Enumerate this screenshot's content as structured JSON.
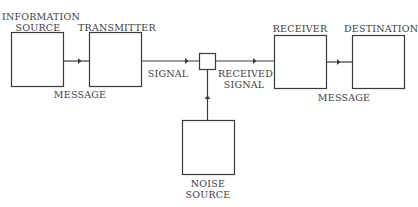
{
  "diagram": {
    "title": "",
    "nodes": [
      {
        "id": "information_source",
        "label_line1": "INFORMATION",
        "label_line2": "SOURCE"
      },
      {
        "id": "transmitter",
        "label_line1": "TRANSMITTER"
      },
      {
        "id": "receiver",
        "label_line1": "RECEIVER"
      },
      {
        "id": "destination",
        "label_line1": "DESTINATION"
      },
      {
        "id": "noise_source",
        "label_line1": "NOISE",
        "label_line2": "SOURCE"
      }
    ],
    "edges": [
      {
        "from": "information_source",
        "to": "transmitter",
        "label": "MESSAGE"
      },
      {
        "from": "transmitter",
        "to": "mixer",
        "label": "SIGNAL"
      },
      {
        "from": "mixer",
        "to": "receiver",
        "label_line1": "RECEIVED",
        "label_line2": "SIGNAL"
      },
      {
        "from": "receiver",
        "to": "destination",
        "label": "MESSAGE"
      },
      {
        "from": "noise_source",
        "to": "mixer",
        "label": ""
      }
    ],
    "colors": {
      "stroke": "#3a3a3a",
      "background": "#ffffff"
    }
  }
}
